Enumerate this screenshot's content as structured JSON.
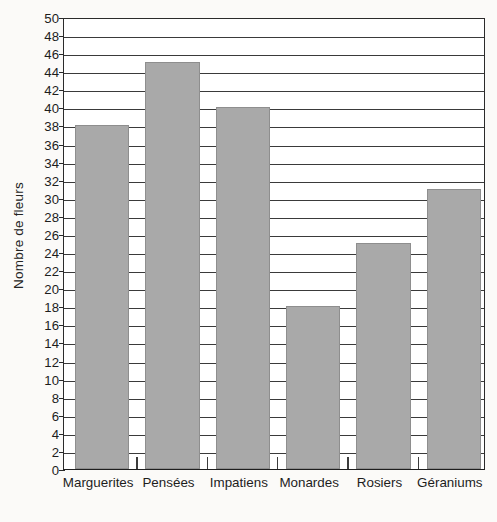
{
  "chart_data": {
    "type": "bar",
    "title": "",
    "subtitle": "",
    "xlabel": "",
    "ylabel": "Nombre de fleurs",
    "categories": [
      "Marguerites",
      "Pensées",
      "Impatiens",
      "Monardes",
      "Rosiers",
      "Géraniums"
    ],
    "values": [
      38,
      45,
      40,
      18,
      25,
      31
    ],
    "ylim": [
      0,
      50
    ],
    "ytick_step": 2,
    "yticks": [
      0,
      2,
      4,
      6,
      8,
      10,
      12,
      14,
      16,
      18,
      20,
      22,
      24,
      26,
      28,
      30,
      32,
      34,
      36,
      38,
      40,
      42,
      44,
      46,
      48,
      50
    ],
    "ytick_labels": [
      "0",
      "2",
      "4",
      "6",
      "8",
      "10",
      "12",
      "14",
      "16",
      "18",
      "20",
      "22",
      "24",
      "26",
      "28",
      "30",
      "32",
      "34",
      "36",
      "38",
      "40",
      "42",
      "44",
      "46",
      "48",
      "50"
    ],
    "grid": true,
    "grid_axis": "y",
    "legend": false,
    "legend_position": "none",
    "bar_color": "#a9a9a9",
    "bar_edge_color": "#8e8e8e",
    "axis_color": "#2b2b2b",
    "grid_color": "#3a3a3a",
    "plot_background": "#ffffff",
    "figure_background": "#fbfaf8",
    "annotations": []
  },
  "figure": {
    "y_axis_title": "Nombre de fleurs"
  }
}
